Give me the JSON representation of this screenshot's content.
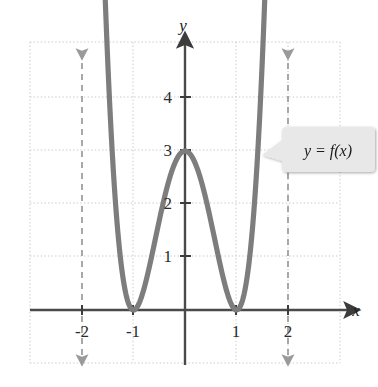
{
  "figure": {
    "title": "",
    "background_color": "#ffffff"
  },
  "axes": {
    "x_axis_label": "x",
    "y_axis_label": "y",
    "axis_color": "#4a4a4a",
    "x_tick_labels": [
      "-2",
      "-1",
      "1",
      "2"
    ],
    "x_tick_values": [
      -2,
      -1,
      1,
      2
    ],
    "y_tick_labels": [
      "1",
      "2",
      "3",
      "4"
    ],
    "y_tick_values": [
      1,
      2,
      3,
      4
    ],
    "grid_color": "#c9c9c9",
    "grid_style": "dotted"
  },
  "annotations": {
    "curve_label": "y = f(x)",
    "callout_fill": "#e8e8e8"
  },
  "chart_data": {
    "type": "line",
    "title": "",
    "xlabel": "x",
    "ylabel": "y",
    "xlim": [
      -2.55,
      3.05
    ],
    "ylim": [
      -0.95,
      5.1
    ],
    "grid": true,
    "legend": null,
    "curve_color": "#7d7d7d",
    "series": [
      {
        "name": "y = f(x)",
        "equation": "f(x) = 3(x^2 - 1)^2",
        "x": [
          -1.62,
          -1.55,
          -1.5,
          -1.45,
          -1.4,
          -1.35,
          -1.3,
          -1.25,
          -1.2,
          -1.15,
          -1.1,
          -1.05,
          -1.0,
          -0.95,
          -0.9,
          -0.85,
          -0.8,
          -0.75,
          -0.7,
          -0.65,
          -0.6,
          -0.55,
          -0.5,
          -0.45,
          -0.4,
          -0.35,
          -0.3,
          -0.25,
          -0.2,
          -0.15,
          -0.1,
          -0.05,
          0.0,
          0.05,
          0.1,
          0.15,
          0.2,
          0.25,
          0.3,
          0.35,
          0.4,
          0.45,
          0.5,
          0.55,
          0.6,
          0.65,
          0.7,
          0.75,
          0.8,
          0.85,
          0.9,
          0.95,
          1.0,
          1.05,
          1.1,
          1.15,
          1.2,
          1.25,
          1.3,
          1.35,
          1.4,
          1.45,
          1.5,
          1.55,
          1.62
        ],
        "y": [
          5.35,
          4.48,
          3.91,
          3.38,
          2.88,
          2.43,
          2.02,
          1.65,
          1.32,
          1.03,
          0.79,
          0.58,
          0.0,
          0.08,
          0.11,
          0.23,
          0.39,
          0.58,
          0.78,
          0.99,
          1.19,
          1.39,
          1.56,
          1.73,
          1.87,
          2.0,
          2.1,
          2.2,
          2.27,
          2.33,
          2.37,
          2.39,
          3.0,
          2.39,
          2.37,
          2.33,
          2.27,
          2.2,
          2.1,
          2.0,
          1.87,
          1.73,
          1.56,
          1.39,
          1.19,
          0.99,
          0.78,
          0.58,
          0.39,
          0.23,
          0.11,
          0.08,
          0.0,
          0.58,
          0.79,
          1.03,
          1.32,
          1.65,
          2.02,
          2.43,
          2.88,
          3.38,
          3.91,
          4.48,
          5.35
        ],
        "key_points": [
          {
            "x": -1,
            "y": 0,
            "kind": "minimum"
          },
          {
            "x": 0,
            "y": 3,
            "kind": "local-maximum"
          },
          {
            "x": 1,
            "y": 0,
            "kind": "minimum"
          }
        ],
        "arrow_ends": [
          "up-left",
          "up-right"
        ]
      }
    ],
    "reference_lines": [
      {
        "type": "vertical",
        "x": -2,
        "style": "dashed",
        "color": "#9a9a9a",
        "arrows": "both"
      },
      {
        "type": "vertical",
        "x": 2,
        "style": "dashed",
        "color": "#9a9a9a",
        "arrows": "both"
      }
    ]
  }
}
